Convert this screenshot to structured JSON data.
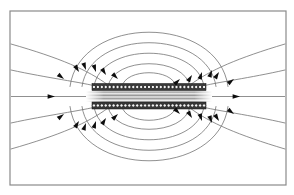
{
  "figure": {
    "kind": "field-line-diagram",
    "frame": {
      "x": 10,
      "y": 11,
      "width": 276,
      "height": 174,
      "color": "#8a8a8a"
    },
    "canvas": {
      "width": 294,
      "height": 195,
      "background": "#ffffff"
    }
  },
  "colors": {
    "field_line": "#6b6b6b",
    "arrow": "#0d0d0d",
    "coil_dark": "#3a3a3a",
    "coil_turn_fill": "#f2f2f2",
    "coil_turn_stroke": "#111111",
    "frame": "#8a8a8a",
    "core_shade": "#9a9a9a",
    "background": "#ffffff"
  },
  "chart_data": {
    "type": "line",
    "xlabel": "",
    "ylabel": "",
    "xlim": [
      10,
      286
    ],
    "ylim": [
      11,
      185
    ],
    "grid": false,
    "legend": null,
    "annotations": [],
    "axis_of_symmetry": {
      "y": 96.5,
      "x_start": 11,
      "x_end": 285
    },
    "coil": {
      "label": "coil winding cross-section",
      "x_left": 92,
      "x_right": 206,
      "upper_band": {
        "y_top": 83.5,
        "y_bottom": 90.5,
        "turn_count": 29
      },
      "lower_band": {
        "y_top": 102.0,
        "y_bottom": 109.0,
        "turn_count": 29
      },
      "core": {
        "y_top": 90.5,
        "y_bottom": 102.0,
        "shading": "horizontal-striations"
      }
    },
    "series": [
      {
        "name": "axis-field-line",
        "kind": "straight",
        "points": [
          [
            11,
            96.5
          ],
          [
            285,
            96.5
          ]
        ]
      },
      {
        "name": "outer-line-1-upper-left",
        "kind": "curve",
        "path": "M 11,44 C 60,58 88,70 108,85"
      },
      {
        "name": "outer-line-1-upper-right",
        "kind": "curve",
        "path": "M 190,85 C 210,70 238,58 285,44"
      },
      {
        "name": "outer-line-2-upper-left",
        "kind": "curve",
        "path": "M 11,70 C 48,78 80,82 100,87"
      },
      {
        "name": "outer-line-2-upper-right",
        "kind": "curve",
        "path": "M 198,87 C 218,82 250,78 285,70"
      },
      {
        "name": "arc-upper-1",
        "kind": "arc",
        "apex_y": 16,
        "x_left": 70,
        "x_right": 228
      },
      {
        "name": "arc-upper-2",
        "kind": "arc",
        "apex_y": 30,
        "x_left": 82,
        "x_right": 216
      },
      {
        "name": "arc-upper-3",
        "kind": "arc",
        "apex_y": 44,
        "x_left": 94,
        "x_right": 204
      },
      {
        "name": "arc-upper-4",
        "kind": "arc",
        "apex_y": 58,
        "x_left": 108,
        "x_right": 190
      },
      {
        "name": "arc-upper-5",
        "kind": "arc",
        "apex_y": 70,
        "x_left": 122,
        "x_right": 176
      },
      {
        "name": "outer-line-1-lower-left",
        "kind": "curve",
        "path": "M 11,149 C 60,135 88,123 108,108"
      },
      {
        "name": "outer-line-1-lower-right",
        "kind": "curve",
        "path": "M 190,108 C 210,123 238,135 285,149"
      },
      {
        "name": "outer-line-2-lower-left",
        "kind": "curve",
        "path": "M 11,123 C 48,115 80,111 100,106"
      },
      {
        "name": "outer-line-2-lower-right",
        "kind": "curve",
        "path": "M 198,106 C 218,111 250,115 285,123"
      },
      {
        "name": "arc-lower-1",
        "kind": "arc",
        "apex_y": 177,
        "x_left": 70,
        "x_right": 228
      },
      {
        "name": "arc-lower-2",
        "kind": "arc",
        "apex_y": 163,
        "x_left": 82,
        "x_right": 216
      },
      {
        "name": "arc-lower-3",
        "kind": "arc",
        "apex_y": 149,
        "x_left": 94,
        "x_right": 204
      },
      {
        "name": "arc-lower-4",
        "kind": "arc",
        "apex_y": 135,
        "x_left": 108,
        "x_right": 190
      },
      {
        "name": "arc-lower-5",
        "kind": "arc",
        "apex_y": 123,
        "x_left": 122,
        "x_right": 176
      }
    ],
    "arrows": [
      {
        "name": "axis-arrow-left",
        "x": 55,
        "y": 96.5,
        "angle": 0,
        "direction": "right"
      },
      {
        "name": "axis-arrow-right",
        "x": 240,
        "y": 96.5,
        "angle": 0,
        "direction": "right"
      },
      {
        "name": "upper-left-a",
        "x": 64,
        "y": 79,
        "angle": 38,
        "direction": "down-right"
      },
      {
        "name": "upper-left-b",
        "x": 79,
        "y": 72,
        "angle": 58,
        "direction": "down-right"
      },
      {
        "name": "upper-left-c",
        "x": 86,
        "y": 70,
        "angle": 70,
        "direction": "down"
      },
      {
        "name": "upper-left-d",
        "x": 96,
        "y": 72,
        "angle": 72,
        "direction": "down"
      },
      {
        "name": "upper-left-e",
        "x": 106,
        "y": 75,
        "angle": 58,
        "direction": "down-right"
      },
      {
        "name": "upper-left-f",
        "x": 118,
        "y": 79,
        "angle": 44,
        "direction": "down-right"
      },
      {
        "name": "upper-right-a",
        "x": 180,
        "y": 79,
        "angle": -44,
        "direction": "up-right"
      },
      {
        "name": "upper-right-b",
        "x": 192,
        "y": 75,
        "angle": -58,
        "direction": "up-right"
      },
      {
        "name": "upper-right-c",
        "x": 202,
        "y": 72,
        "angle": -72,
        "direction": "up"
      },
      {
        "name": "upper-right-d",
        "x": 212,
        "y": 70,
        "angle": -70,
        "direction": "up"
      },
      {
        "name": "upper-right-e",
        "x": 219,
        "y": 72,
        "angle": -58,
        "direction": "up-right"
      },
      {
        "name": "upper-right-f",
        "x": 234,
        "y": 79,
        "angle": -38,
        "direction": "up-right"
      },
      {
        "name": "lower-left-a",
        "x": 64,
        "y": 114,
        "angle": -38,
        "direction": "up-right"
      },
      {
        "name": "lower-left-b",
        "x": 79,
        "y": 121,
        "angle": -58,
        "direction": "up-right"
      },
      {
        "name": "lower-left-c",
        "x": 86,
        "y": 123,
        "angle": -70,
        "direction": "up"
      },
      {
        "name": "lower-left-d",
        "x": 96,
        "y": 121,
        "angle": -72,
        "direction": "up"
      },
      {
        "name": "lower-left-e",
        "x": 106,
        "y": 118,
        "angle": -58,
        "direction": "up-right"
      },
      {
        "name": "lower-left-f",
        "x": 118,
        "y": 114,
        "angle": -44,
        "direction": "up-right"
      },
      {
        "name": "lower-right-a",
        "x": 180,
        "y": 114,
        "angle": 44,
        "direction": "down-right"
      },
      {
        "name": "lower-right-b",
        "x": 192,
        "y": 118,
        "angle": 58,
        "direction": "down-right"
      },
      {
        "name": "lower-right-c",
        "x": 202,
        "y": 121,
        "angle": 72,
        "direction": "down"
      },
      {
        "name": "lower-right-d",
        "x": 212,
        "y": 123,
        "angle": 70,
        "direction": "down"
      },
      {
        "name": "lower-right-e",
        "x": 219,
        "y": 121,
        "angle": 58,
        "direction": "down-right"
      },
      {
        "name": "lower-right-f",
        "x": 234,
        "y": 114,
        "angle": 38,
        "direction": "down-right"
      }
    ]
  }
}
